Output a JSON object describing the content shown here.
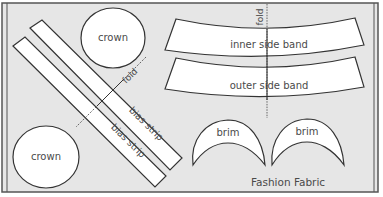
{
  "diagram": {
    "title": "Fashion Fabric",
    "colors": {
      "fabric_bg": "#e6e6e6",
      "piece_fill": "#ffffff",
      "outline": "#333333",
      "text": "#4a4a4a",
      "frame": "#555555"
    },
    "pieces": {
      "crown_top": {
        "label": "crown"
      },
      "crown_bottom": {
        "label": "crown"
      },
      "bias_strip_1": {
        "label": "bias strip"
      },
      "bias_strip_2": {
        "label": "bias strip"
      },
      "inner_side_band": {
        "label": "inner side band"
      },
      "outer_side_band": {
        "label": "outer side band"
      },
      "brim_left": {
        "label": "brim"
      },
      "brim_right": {
        "label": "brim"
      }
    },
    "fold_labels": {
      "bias_fold": "fold",
      "band_fold": "fold"
    },
    "fabric_label": "Fashion Fabric"
  }
}
